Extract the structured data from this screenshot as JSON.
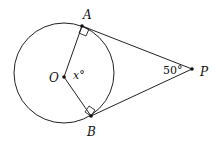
{
  "diagram": {
    "points": {
      "A": {
        "label": "A"
      },
      "B": {
        "label": "B"
      },
      "O": {
        "label": "O"
      },
      "P": {
        "label": "P"
      }
    },
    "angle_center": {
      "label": "x°"
    },
    "angle_P": {
      "label": "50°"
    }
  }
}
